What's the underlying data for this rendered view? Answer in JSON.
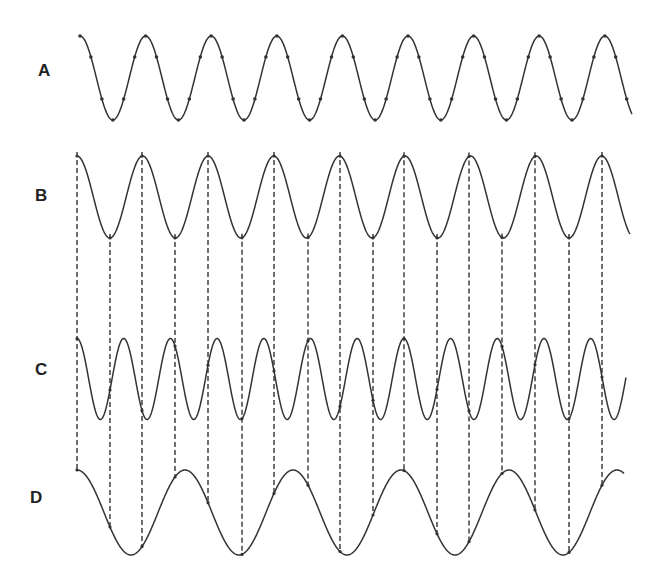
{
  "figure": {
    "stroke_color": "#333333",
    "dash_color": "#333333"
  },
  "waves": [
    {
      "label": "A",
      "label_x": 38,
      "label_y": 61,
      "x_start": 80,
      "x_end": 632,
      "center_y": 78,
      "amplitude": 42,
      "period": 65.6,
      "phase_peak_x": 80,
      "markers": true
    },
    {
      "label": "B",
      "label_x": 35,
      "label_y": 186,
      "x_start": 77,
      "x_end": 630,
      "center_y": 197,
      "amplitude": 41,
      "period": 65.6,
      "phase_peak_x": 77,
      "markers": false
    },
    {
      "label": "C",
      "label_x": 35,
      "label_y": 360,
      "x_start": 77,
      "x_end": 626,
      "center_y": 379,
      "amplitude": 40.5,
      "period": 46.7,
      "phase_peak_x": 77,
      "markers": false
    },
    {
      "label": "D",
      "label_x": 30,
      "label_y": 488,
      "x_start": 77,
      "x_end": 624,
      "center_y": 512.5,
      "amplitude": 42.5,
      "period": 108,
      "phase_peak_x": 77,
      "markers": false
    }
  ],
  "dashed_lines": {
    "source_wave": "B",
    "target_wave": "D",
    "x_positions": [
      77,
      110,
      142,
      175,
      208,
      242,
      274,
      308,
      340,
      373,
      404,
      437,
      469,
      502,
      535,
      569,
      602
    ]
  }
}
